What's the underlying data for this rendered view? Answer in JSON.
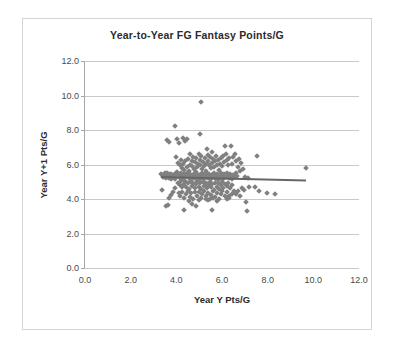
{
  "chart": {
    "title": "Year-to-Year FG Fantasy Points/G",
    "xlabel": "Year Y Pts/G",
    "ylabel": "Year Y+1 Pts/G"
  },
  "chart_data": {
    "type": "scatter",
    "title": "Year-to-Year FG Fantasy Points/G",
    "xlabel": "Year Y Pts/G",
    "ylabel": "Year Y+1 Pts/G",
    "xlim": [
      0.0,
      12.0
    ],
    "ylim": [
      0.0,
      12.0
    ],
    "xticks": [
      0.0,
      2.0,
      4.0,
      6.0,
      8.0,
      10.0,
      12.0
    ],
    "yticks": [
      0.0,
      2.0,
      4.0,
      6.0,
      8.0,
      10.0,
      12.0
    ],
    "xtick_labels": [
      "0.0",
      "2.0",
      "4.0",
      "6.0",
      "8.0",
      "10.0",
      "12.0"
    ],
    "ytick_labels": [
      "0.0",
      "2.0",
      "4.0",
      "6.0",
      "8.0",
      "10.0",
      "12.0"
    ],
    "grid": "horizontal",
    "legend": "none",
    "marker": {
      "shape": "diamond",
      "color": "#808080",
      "size": 4
    },
    "series": [
      {
        "name": "Players",
        "points": [
          [
            3.35,
            5.45
          ],
          [
            3.4,
            5.38
          ],
          [
            3.42,
            5.3
          ],
          [
            3.45,
            5.42
          ],
          [
            3.48,
            5.25
          ],
          [
            3.5,
            5.5
          ],
          [
            3.52,
            5.35
          ],
          [
            3.55,
            5.2
          ],
          [
            3.58,
            5.48
          ],
          [
            3.6,
            5.32
          ],
          [
            3.62,
            5.28
          ],
          [
            3.65,
            5.4
          ],
          [
            3.68,
            5.22
          ],
          [
            3.7,
            5.44
          ],
          [
            3.72,
            5.36
          ],
          [
            3.75,
            5.18
          ],
          [
            3.78,
            5.46
          ],
          [
            3.8,
            5.3
          ],
          [
            3.82,
            5.24
          ],
          [
            3.85,
            5.38
          ],
          [
            3.88,
            5.26
          ],
          [
            3.9,
            5.42
          ],
          [
            3.92,
            5.34
          ],
          [
            3.95,
            5.16
          ],
          [
            3.98,
            5.48
          ],
          [
            3.38,
            4.55
          ],
          [
            3.55,
            3.6
          ],
          [
            3.62,
            3.68
          ],
          [
            3.7,
            4.05
          ],
          [
            3.78,
            4.22
          ],
          [
            3.85,
            4.38
          ],
          [
            3.92,
            4.62
          ],
          [
            3.6,
            7.42
          ],
          [
            3.68,
            7.3
          ],
          [
            3.95,
            8.25
          ],
          [
            4.05,
            7.48
          ],
          [
            4.12,
            7.22
          ],
          [
            4.3,
            7.52
          ],
          [
            4.38,
            7.38
          ],
          [
            4.48,
            7.5
          ],
          [
            5.05,
            7.78
          ],
          [
            5.1,
            9.65
          ],
          [
            4.0,
            6.42
          ],
          [
            4.08,
            6.1
          ],
          [
            4.15,
            5.95
          ],
          [
            4.2,
            6.25
          ],
          [
            4.25,
            5.8
          ],
          [
            4.3,
            6.05
          ],
          [
            4.35,
            5.7
          ],
          [
            4.4,
            6.18
          ],
          [
            4.45,
            5.88
          ],
          [
            4.5,
            6.3
          ],
          [
            4.55,
            5.62
          ],
          [
            4.6,
            6.0
          ],
          [
            4.62,
            6.58
          ],
          [
            4.68,
            6.22
          ],
          [
            4.7,
            5.92
          ],
          [
            4.75,
            6.45
          ],
          [
            4.78,
            5.75
          ],
          [
            4.82,
            6.12
          ],
          [
            4.85,
            5.58
          ],
          [
            4.88,
            6.35
          ],
          [
            4.92,
            5.85
          ],
          [
            4.95,
            6.05
          ],
          [
            4.98,
            6.62
          ],
          [
            5.02,
            6.28
          ],
          [
            5.05,
            5.98
          ],
          [
            5.1,
            6.48
          ],
          [
            5.12,
            5.72
          ],
          [
            5.18,
            6.15
          ],
          [
            5.2,
            5.9
          ],
          [
            5.25,
            6.38
          ],
          [
            5.28,
            5.65
          ],
          [
            5.32,
            6.02
          ],
          [
            5.35,
            6.92
          ],
          [
            5.38,
            6.55
          ],
          [
            5.4,
            6.2
          ],
          [
            5.45,
            5.95
          ],
          [
            5.48,
            6.42
          ],
          [
            5.52,
            5.78
          ],
          [
            5.55,
            6.08
          ],
          [
            5.58,
            6.72
          ],
          [
            5.62,
            6.3
          ],
          [
            5.65,
            5.88
          ],
          [
            5.7,
            6.18
          ],
          [
            5.72,
            6.5
          ],
          [
            5.78,
            5.98
          ],
          [
            5.82,
            6.25
          ],
          [
            5.85,
            5.7
          ],
          [
            5.9,
            6.02
          ],
          [
            5.95,
            6.38
          ],
          [
            6.0,
            5.92
          ],
          [
            6.05,
            6.48
          ],
          [
            6.1,
            6.12
          ],
          [
            6.15,
            7.05
          ],
          [
            6.18,
            6.62
          ],
          [
            6.22,
            6.28
          ],
          [
            6.28,
            5.98
          ],
          [
            6.32,
            6.35
          ],
          [
            6.38,
            7.1
          ],
          [
            6.42,
            6.05
          ],
          [
            6.48,
            6.42
          ],
          [
            4.05,
            5.55
          ],
          [
            4.1,
            5.4
          ],
          [
            4.15,
            5.22
          ],
          [
            4.2,
            5.48
          ],
          [
            4.25,
            5.32
          ],
          [
            4.3,
            5.18
          ],
          [
            4.35,
            5.44
          ],
          [
            4.4,
            5.28
          ],
          [
            4.45,
            5.52
          ],
          [
            4.5,
            5.36
          ],
          [
            4.55,
            5.2
          ],
          [
            4.58,
            5.46
          ],
          [
            4.62,
            5.3
          ],
          [
            4.68,
            5.14
          ],
          [
            4.72,
            5.42
          ],
          [
            4.75,
            5.26
          ],
          [
            4.8,
            5.5
          ],
          [
            4.85,
            5.34
          ],
          [
            4.88,
            5.18
          ],
          [
            4.92,
            5.45
          ],
          [
            4.96,
            5.28
          ],
          [
            5.0,
            5.12
          ],
          [
            5.04,
            5.4
          ],
          [
            5.08,
            5.24
          ],
          [
            5.12,
            5.48
          ],
          [
            5.16,
            5.32
          ],
          [
            5.2,
            5.16
          ],
          [
            5.24,
            5.44
          ],
          [
            5.28,
            5.28
          ],
          [
            5.32,
            5.52
          ],
          [
            5.36,
            5.35
          ],
          [
            5.4,
            5.19
          ],
          [
            5.44,
            5.46
          ],
          [
            5.48,
            5.3
          ],
          [
            5.52,
            5.14
          ],
          [
            5.56,
            5.42
          ],
          [
            5.6,
            5.25
          ],
          [
            5.64,
            5.5
          ],
          [
            5.68,
            5.34
          ],
          [
            5.72,
            5.18
          ],
          [
            5.76,
            5.45
          ],
          [
            5.8,
            5.28
          ],
          [
            5.84,
            5.12
          ],
          [
            5.88,
            5.4
          ],
          [
            5.92,
            5.24
          ],
          [
            5.96,
            5.48
          ],
          [
            6.0,
            5.32
          ],
          [
            6.05,
            5.16
          ],
          [
            6.1,
            5.44
          ],
          [
            6.15,
            5.28
          ],
          [
            6.2,
            5.52
          ],
          [
            6.25,
            5.35
          ],
          [
            6.3,
            5.2
          ],
          [
            6.35,
            5.46
          ],
          [
            6.4,
            5.3
          ],
          [
            6.45,
            5.14
          ],
          [
            6.5,
            5.42
          ],
          [
            6.55,
            5.26
          ],
          [
            6.6,
            5.48
          ],
          [
            6.65,
            5.32
          ],
          [
            4.08,
            4.95
          ],
          [
            4.14,
            4.8
          ],
          [
            4.2,
            5.02
          ],
          [
            4.26,
            4.68
          ],
          [
            4.32,
            4.88
          ],
          [
            4.38,
            5.05
          ],
          [
            4.44,
            4.72
          ],
          [
            4.5,
            4.92
          ],
          [
            4.56,
            4.6
          ],
          [
            4.62,
            5.0
          ],
          [
            4.68,
            4.78
          ],
          [
            4.74,
            4.95
          ],
          [
            4.8,
            4.65
          ],
          [
            4.86,
            4.85
          ],
          [
            4.92,
            5.02
          ],
          [
            4.98,
            4.7
          ],
          [
            5.04,
            4.9
          ],
          [
            5.1,
            4.58
          ],
          [
            5.16,
            4.98
          ],
          [
            5.22,
            4.75
          ],
          [
            5.28,
            4.92
          ],
          [
            5.34,
            4.62
          ],
          [
            5.4,
            4.82
          ],
          [
            5.46,
            5.0
          ],
          [
            5.52,
            4.68
          ],
          [
            5.58,
            4.88
          ],
          [
            5.64,
            4.55
          ],
          [
            5.7,
            4.95
          ],
          [
            5.76,
            4.72
          ],
          [
            5.82,
            4.9
          ],
          [
            5.88,
            4.6
          ],
          [
            5.94,
            4.8
          ],
          [
            6.0,
            4.98
          ],
          [
            6.06,
            4.66
          ],
          [
            6.12,
            4.86
          ],
          [
            6.2,
            4.75
          ],
          [
            6.28,
            4.92
          ],
          [
            6.36,
            4.62
          ],
          [
            6.44,
            4.84
          ],
          [
            4.1,
            4.35
          ],
          [
            4.18,
            4.18
          ],
          [
            4.26,
            4.42
          ],
          [
            4.34,
            4.05
          ],
          [
            4.42,
            4.28
          ],
          [
            4.5,
            4.45
          ],
          [
            4.58,
            4.12
          ],
          [
            4.66,
            4.32
          ],
          [
            4.74,
            3.98
          ],
          [
            4.82,
            4.38
          ],
          [
            4.9,
            4.2
          ],
          [
            4.98,
            4.42
          ],
          [
            5.06,
            4.08
          ],
          [
            5.14,
            4.3
          ],
          [
            5.22,
            4.48
          ],
          [
            5.3,
            4.15
          ],
          [
            5.38,
            4.35
          ],
          [
            5.46,
            4.02
          ],
          [
            5.54,
            4.25
          ],
          [
            5.62,
            4.44
          ],
          [
            5.7,
            4.1
          ],
          [
            5.78,
            4.32
          ],
          [
            5.86,
            3.98
          ],
          [
            5.94,
            4.28
          ],
          [
            6.02,
            4.45
          ],
          [
            6.12,
            4.15
          ],
          [
            6.22,
            4.38
          ],
          [
            6.32,
            4.05
          ],
          [
            6.42,
            4.3
          ],
          [
            6.52,
            4.48
          ],
          [
            4.35,
            3.38
          ],
          [
            4.55,
            3.88
          ],
          [
            4.7,
            3.72
          ],
          [
            4.85,
            3.62
          ],
          [
            5.0,
            3.92
          ],
          [
            5.3,
            4.02
          ],
          [
            5.4,
            3.92
          ],
          [
            5.55,
            3.38
          ],
          [
            5.6,
            4.05
          ],
          [
            5.8,
            3.88
          ],
          [
            6.2,
            4.02
          ],
          [
            6.3,
            4.15
          ],
          [
            6.55,
            6.62
          ],
          [
            6.62,
            6.18
          ],
          [
            6.7,
            5.88
          ],
          [
            6.75,
            6.32
          ],
          [
            6.8,
            5.6
          ],
          [
            6.85,
            6.08
          ],
          [
            6.9,
            5.72
          ],
          [
            6.95,
            4.55
          ],
          [
            7.0,
            5.28
          ],
          [
            7.05,
            3.85
          ],
          [
            7.1,
            3.28
          ],
          [
            6.6,
            4.3
          ],
          [
            6.68,
            4.45
          ],
          [
            6.78,
            4.18
          ],
          [
            6.88,
            4.62
          ],
          [
            7.15,
            5.22
          ],
          [
            7.2,
            4.68
          ],
          [
            7.45,
            4.72
          ],
          [
            7.55,
            6.48
          ],
          [
            7.62,
            4.45
          ],
          [
            7.95,
            4.35
          ],
          [
            8.3,
            4.28
          ],
          [
            9.68,
            5.78
          ]
        ]
      }
    ],
    "trendline": {
      "x0": 3.35,
      "y0": 5.32,
      "x1": 9.68,
      "y1": 5.12,
      "color": "#666666",
      "note": "slight negative slope, near-flat"
    }
  }
}
